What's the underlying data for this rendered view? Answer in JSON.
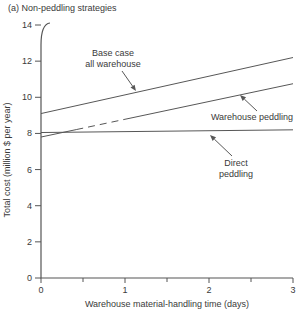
{
  "chart_data": {
    "type": "line",
    "title": "(a) Non-peddling strategies",
    "xlabel": "Warehouse material-handling time (days)",
    "ylabel": "Total cost (million $ per year)",
    "xlim": [
      0,
      3
    ],
    "ylim": [
      0,
      14
    ],
    "xticks_major": [
      0,
      1,
      2,
      3
    ],
    "xticks_minor": [
      0.5,
      1.5,
      2.5
    ],
    "yticks": [
      0,
      2,
      4,
      6,
      8,
      10,
      12,
      14
    ],
    "grid": false,
    "legend_position": "none",
    "series": [
      {
        "name": "Base case all warehouse",
        "points": [
          [
            0,
            9.1
          ],
          [
            3,
            12.2
          ]
        ]
      },
      {
        "name": "Warehouse peddling",
        "points": [
          [
            0,
            7.8
          ],
          [
            3,
            10.75
          ]
        ],
        "faded_segment_days": [
          0.42,
          1.0
        ]
      },
      {
        "name": "Direct peddling",
        "points": [
          [
            0,
            8.05
          ],
          [
            3,
            8.2
          ]
        ]
      }
    ],
    "annotations": [
      {
        "label_lines": [
          "Base case",
          "all warehouse"
        ],
        "text_px": [
          113,
          56
        ],
        "arrow_from_px": [
          122,
          71
        ],
        "arrow_to_px": [
          136,
          91
        ]
      },
      {
        "label_lines": [
          "Warehouse peddling"
        ],
        "text_px": [
          252,
          120
        ],
        "arrow_from_px": [
          257,
          111
        ],
        "arrow_to_px": [
          240,
          95
        ]
      },
      {
        "label_lines": [
          "Direct",
          "peddling"
        ],
        "text_px": [
          236,
          166
        ],
        "arrow_from_px": [
          232,
          156
        ],
        "arrow_to_px": [
          210,
          135
        ]
      }
    ],
    "plot_px": {
      "left": 41,
      "right": 293,
      "top": 25,
      "bottom": 278
    },
    "line_height_px": 11
  },
  "colors": {
    "background": "#ffffff",
    "axis": "#555555",
    "line": "#575757",
    "text": "#3a3a3a"
  }
}
